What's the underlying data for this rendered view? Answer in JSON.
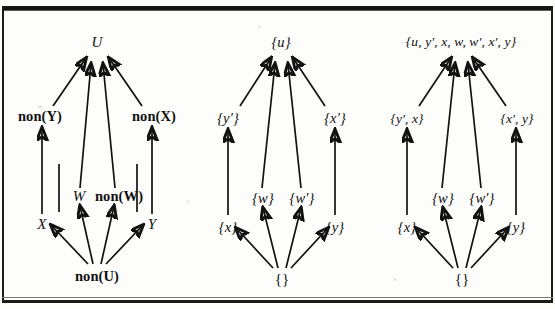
{
  "figure": {
    "caption": "",
    "panel_count": 3,
    "ink_color": "#121212",
    "paper_color": "#fdfdfb"
  },
  "panels": [
    {
      "id": "panel-left",
      "name": "predicate-lattice",
      "nodes": {
        "top": "U",
        "upper_left": "non(Y)",
        "upper_right": "non(X)",
        "mid_left": "W",
        "mid_right": "non(W)",
        "lower_left": "X",
        "lower_right": "Y",
        "bottom": "non(U)"
      }
    },
    {
      "id": "panel-middle",
      "name": "singleton-set-lattice",
      "nodes": {
        "top": "{u}",
        "upper_left": "{y′}",
        "upper_right": "{x′}",
        "mid_left": "{w}",
        "mid_right": "{w′}",
        "lower_left": "{x}",
        "lower_right": "{y}",
        "bottom": "{}"
      }
    },
    {
      "id": "panel-right",
      "name": "closure-set-lattice",
      "nodes": {
        "top": "{u, y′, x, w, w′, x′, y}",
        "upper_left": "{y′, x}",
        "upper_right": "{x′, y}",
        "mid_left": "{w}",
        "mid_right": "{w′}",
        "lower_left": "{x}",
        "lower_right": "{y}",
        "bottom": "{}"
      }
    }
  ],
  "edges": {
    "description": "Arrows point upward from lower element to covering element",
    "list": [
      "bottom -> lower_left",
      "bottom -> mid_left",
      "bottom -> mid_right",
      "bottom -> lower_right",
      "lower_left -> upper_left",
      "lower_right -> upper_right",
      "mid_left -> top",
      "mid_right -> top",
      "upper_left -> top",
      "upper_right -> top"
    ]
  }
}
